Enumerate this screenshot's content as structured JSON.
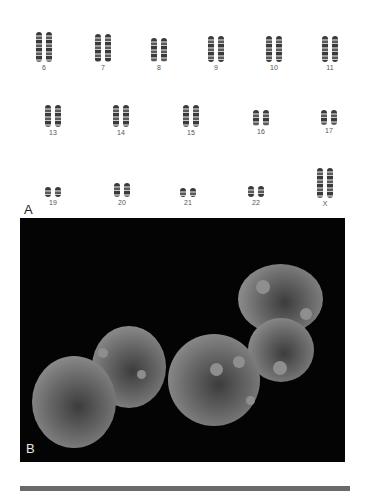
{
  "figure": {
    "panel_a": {
      "label": "A",
      "rows": [
        [
          {
            "id": "6",
            "label": "6",
            "x": 46,
            "y": 32,
            "h": 30
          },
          {
            "id": "7",
            "label": "7",
            "x": 105,
            "y": 34,
            "h": 28
          },
          {
            "id": "8",
            "label": "8",
            "x": 161,
            "y": 38,
            "h": 24
          },
          {
            "id": "9",
            "label": "9",
            "x": 218,
            "y": 36,
            "h": 26
          },
          {
            "id": "10",
            "label": "10",
            "x": 276,
            "y": 36,
            "h": 26
          },
          {
            "id": "11",
            "label": "11",
            "x": 332,
            "y": 36,
            "h": 26
          }
        ],
        [
          {
            "id": "13",
            "label": "13",
            "x": 55,
            "y": 105,
            "h": 22
          },
          {
            "id": "14",
            "label": "14",
            "x": 123,
            "y": 105,
            "h": 22
          },
          {
            "id": "15",
            "label": "15",
            "x": 193,
            "y": 105,
            "h": 22
          },
          {
            "id": "16",
            "label": "16",
            "x": 263,
            "y": 110,
            "h": 16
          },
          {
            "id": "17",
            "label": "17",
            "x": 331,
            "y": 110,
            "h": 15
          }
        ],
        [
          {
            "id": "19",
            "label": "19",
            "x": 55,
            "y": 187,
            "h": 10
          },
          {
            "id": "20",
            "label": "20",
            "x": 124,
            "y": 183,
            "h": 14
          },
          {
            "id": "21",
            "label": "21",
            "x": 190,
            "y": 188,
            "h": 9
          },
          {
            "id": "22",
            "label": "22",
            "x": 258,
            "y": 186,
            "h": 11
          },
          {
            "id": "X",
            "label": "X",
            "x": 327,
            "y": 168,
            "h": 30
          }
        ]
      ]
    },
    "panel_b": {
      "label": "B",
      "cells": [
        {
          "x": 12,
          "y": 138,
          "w": 84,
          "h": 92
        },
        {
          "x": 72,
          "y": 108,
          "w": 74,
          "h": 82
        },
        {
          "x": 148,
          "y": 116,
          "w": 92,
          "h": 92
        },
        {
          "x": 228,
          "y": 100,
          "w": 66,
          "h": 64
        },
        {
          "x": 218,
          "y": 46,
          "w": 85,
          "h": 70
        }
      ],
      "spots": [
        {
          "x": 236,
          "y": 62,
          "s": 14
        },
        {
          "x": 280,
          "y": 90,
          "s": 12
        },
        {
          "x": 190,
          "y": 145,
          "s": 13
        },
        {
          "x": 213,
          "y": 138,
          "s": 12
        },
        {
          "x": 253,
          "y": 143,
          "s": 14
        },
        {
          "x": 78,
          "y": 130,
          "s": 10
        },
        {
          "x": 117,
          "y": 152,
          "s": 9
        },
        {
          "x": 226,
          "y": 178,
          "s": 9
        }
      ]
    },
    "table_header": {
      "label": "Table 25.3"
    }
  }
}
